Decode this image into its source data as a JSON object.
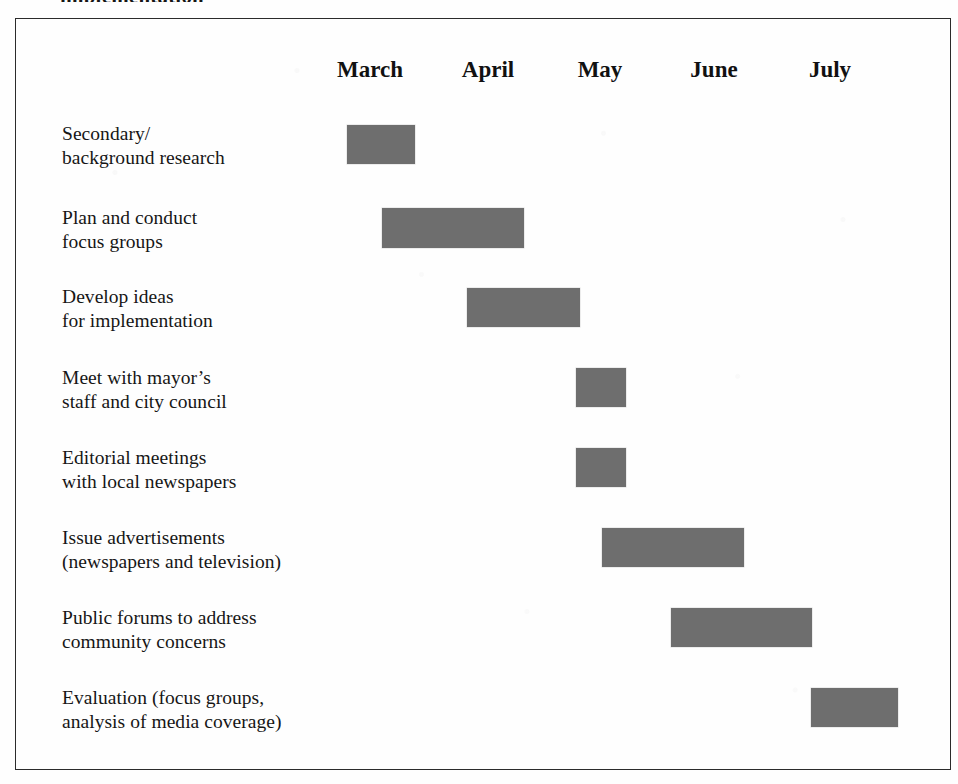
{
  "figure": {
    "top_clipped_fragment": "implementation",
    "frame": {
      "border_color": "#2b2b2b",
      "background": "#fefefe"
    },
    "bar_color": "#6e6e6e"
  },
  "chart_data": {
    "type": "bar",
    "subtype": "gantt",
    "title": "",
    "xlabel": "",
    "ylabel": "",
    "grid": false,
    "legend": false,
    "categories": [
      "Secondary/\nbackground research",
      "Plan and conduct\nfocus groups",
      "Develop ideas\nfor implementation",
      "Meet with mayor’s\nstaff and city council",
      "Editorial meetings\nwith local newspapers",
      "Issue advertisements\n(newspapers and television)",
      "Public forums to address\ncommunity concerns",
      "Evaluation (focus groups,\nanalysis of media coverage)"
    ],
    "axis_tick_labels": [
      "March",
      "April",
      "May",
      "June",
      "July"
    ],
    "axis_tick_x": [
      370,
      488,
      600,
      714,
      830
    ],
    "tasks": [
      {
        "label": "Secondary/\nbackground research",
        "label_x": 62,
        "label_y": 122,
        "bar_x": 347,
        "bar_y": 125,
        "bar_w": 68,
        "bar_h": 39,
        "start_month": "March",
        "end_month": "March"
      },
      {
        "label": "Plan and conduct\nfocus groups",
        "label_x": 62,
        "label_y": 206,
        "bar_x": 382,
        "bar_y": 208,
        "bar_w": 142,
        "bar_h": 40,
        "start_month": "March",
        "end_month": "April"
      },
      {
        "label": "Develop ideas\nfor implementation",
        "label_x": 62,
        "label_y": 285,
        "bar_x": 467,
        "bar_y": 288,
        "bar_w": 113,
        "bar_h": 39,
        "start_month": "April",
        "end_month": "May"
      },
      {
        "label": "Meet with mayor’s\nstaff and city council",
        "label_x": 62,
        "label_y": 366,
        "bar_x": 576,
        "bar_y": 368,
        "bar_w": 50,
        "bar_h": 39,
        "start_month": "May",
        "end_month": "May"
      },
      {
        "label": "Editorial meetings\nwith local newspapers",
        "label_x": 62,
        "label_y": 446,
        "bar_x": 576,
        "bar_y": 448,
        "bar_w": 50,
        "bar_h": 39,
        "start_month": "May",
        "end_month": "May"
      },
      {
        "label": "Issue advertisements\n(newspapers and television)",
        "label_x": 62,
        "label_y": 526,
        "bar_x": 602,
        "bar_y": 528,
        "bar_w": 142,
        "bar_h": 39,
        "start_month": "May",
        "end_month": "June"
      },
      {
        "label": "Public forums to address\ncommunity concerns",
        "label_x": 62,
        "label_y": 606,
        "bar_x": 671,
        "bar_y": 608,
        "bar_w": 141,
        "bar_h": 39,
        "start_month": "June",
        "end_month": "July"
      },
      {
        "label": "Evaluation (focus groups,\nanalysis of media coverage)",
        "label_x": 62,
        "label_y": 686,
        "bar_x": 811,
        "bar_y": 688,
        "bar_w": 87,
        "bar_h": 39,
        "start_month": "July",
        "end_month": "July"
      }
    ]
  }
}
